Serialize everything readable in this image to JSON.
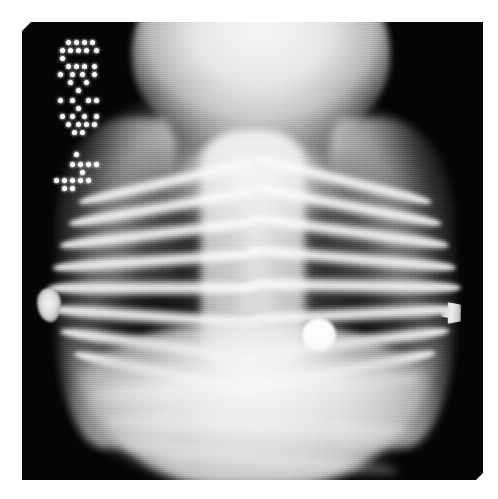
{
  "image": {
    "modality": "X-ray",
    "view": "anteroposterior-chest",
    "subject": "infant",
    "caption": "Pediatric anteroposterior chest radiograph",
    "width": 498,
    "height": 499,
    "background_color": "#ffffff",
    "film_color": "#050505"
  },
  "film": {
    "left": 22,
    "top": 22,
    "width": 461,
    "height": 458
  },
  "annotation": {
    "type": "dot-matrix-burned-in",
    "orientation": "rotated-90",
    "color": "#fdfdfd",
    "description": "Illegible dot-matrix exposure legend in upper-left corner of film",
    "groups": [
      {
        "name": "upper-block",
        "dots": [
          [
            30,
            6
          ],
          [
            38,
            6
          ],
          [
            46,
            6
          ],
          [
            54,
            6
          ],
          [
            24,
            14
          ],
          [
            32,
            14
          ],
          [
            40,
            14
          ],
          [
            48,
            14
          ],
          [
            58,
            14
          ],
          [
            24,
            22
          ],
          [
            30,
            30
          ],
          [
            38,
            30
          ],
          [
            46,
            30
          ],
          [
            56,
            30
          ],
          [
            22,
            38
          ],
          [
            34,
            38
          ],
          [
            44,
            38
          ],
          [
            56,
            38
          ],
          [
            32,
            46
          ],
          [
            48,
            46
          ],
          [
            40,
            54
          ]
        ]
      },
      {
        "name": "middle-block",
        "dots": [
          [
            22,
            64
          ],
          [
            34,
            64
          ],
          [
            50,
            64
          ],
          [
            58,
            64
          ],
          [
            40,
            72
          ],
          [
            24,
            80
          ],
          [
            34,
            80
          ],
          [
            46,
            80
          ],
          [
            58,
            80
          ],
          [
            30,
            88
          ],
          [
            40,
            88
          ],
          [
            48,
            88
          ],
          [
            56,
            88
          ],
          [
            36,
            96
          ],
          [
            44,
            96
          ]
        ]
      },
      {
        "name": "lower-block",
        "dots": [
          [
            38,
            118
          ],
          [
            34,
            128
          ],
          [
            42,
            128
          ],
          [
            50,
            128
          ],
          [
            58,
            128
          ],
          [
            44,
            136
          ],
          [
            18,
            144
          ],
          [
            26,
            144
          ],
          [
            34,
            144
          ],
          [
            42,
            144
          ],
          [
            50,
            144
          ],
          [
            26,
            152
          ],
          [
            34,
            152
          ]
        ]
      }
    ]
  },
  "anatomy": {
    "head": {
      "label": "skull-and-cranium",
      "note": "Large radiodense cranial silhouette occupying the superior film, typical infant head-to-body proportion"
    },
    "thorax": {
      "label": "thorax",
      "lung_left": "left-lung-field",
      "lung_right": "right-lung-field",
      "mediastinum": "central-mediastinum-and-spine",
      "thymus": "thymic-shadow"
    },
    "abdomen": {
      "label": "upper-abdomen",
      "note": "Homogeneously opaque abdominal soft tissue below the diaphragm"
    },
    "ribs": {
      "label": "rib-cage",
      "left_side": [
        {
          "top": 132,
          "left": 52,
          "width": 178,
          "height": 17,
          "rotate": -13
        },
        {
          "top": 160,
          "left": 44,
          "width": 190,
          "height": 18,
          "rotate": -10
        },
        {
          "top": 190,
          "left": 36,
          "width": 200,
          "height": 19,
          "rotate": -7
        },
        {
          "top": 222,
          "left": 30,
          "width": 208,
          "height": 19,
          "rotate": -4
        },
        {
          "top": 256,
          "left": 26,
          "width": 212,
          "height": 20,
          "rotate": 0
        },
        {
          "top": 292,
          "left": 28,
          "width": 210,
          "height": 20,
          "rotate": 4
        },
        {
          "top": 328,
          "left": 36,
          "width": 202,
          "height": 19,
          "rotate": 8
        },
        {
          "top": 362,
          "left": 48,
          "width": 188,
          "height": 18,
          "rotate": 12
        }
      ],
      "right_side": [
        {
          "top": 128,
          "right": 46,
          "width": 182,
          "height": 17,
          "rotate": 14
        },
        {
          "top": 156,
          "right": 38,
          "width": 194,
          "height": 18,
          "rotate": 11
        },
        {
          "top": 186,
          "right": 32,
          "width": 202,
          "height": 19,
          "rotate": 8
        },
        {
          "top": 218,
          "right": 26,
          "width": 210,
          "height": 19,
          "rotate": 5
        },
        {
          "top": 252,
          "right": 22,
          "width": 214,
          "height": 20,
          "rotate": 1
        },
        {
          "top": 288,
          "right": 24,
          "width": 212,
          "height": 20,
          "rotate": -3
        },
        {
          "top": 324,
          "right": 32,
          "width": 204,
          "height": 19,
          "rotate": -7
        },
        {
          "top": 358,
          "right": 44,
          "width": 190,
          "height": 18,
          "rotate": -11
        }
      ]
    },
    "abdominal_bands": [
      {
        "top": 352,
        "left": 70,
        "width": 330,
        "height": 26,
        "rotate": -3
      },
      {
        "top": 392,
        "left": 84,
        "width": 306,
        "height": 24,
        "rotate": 2
      },
      {
        "top": 426,
        "left": 100,
        "width": 276,
        "height": 22,
        "rotate": 5
      }
    ]
  },
  "markers": [
    {
      "name": "ecg-electrode",
      "shape": "disc",
      "description": "Round radiopaque ECG electrode projected over the left lower hemithorax",
      "color": "#ffffff",
      "diameter_px": 34
    },
    {
      "name": "left-edge-marker",
      "shape": "irregular",
      "description": "Small irregular radiopaque object at the patient's right lateral margin",
      "color": "#dcdcdc"
    },
    {
      "name": "right-edge-marker",
      "shape": "flag",
      "description": "Small flag-shaped metallic marker clip at the patient's left lateral margin",
      "color": "#eaeaea"
    }
  ]
}
